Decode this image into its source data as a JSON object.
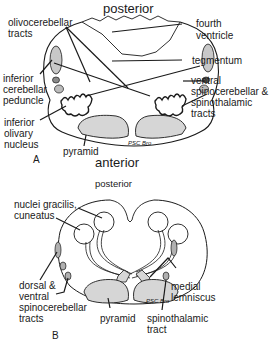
{
  "diagram_a": {
    "panel_letter": "A",
    "orientation_top": "posterior",
    "orientation_bottom": "anterior",
    "labels": {
      "olivocerebellar": [
        "olivocerebellar",
        "tracts"
      ],
      "fourth_ventricle": [
        "fourth",
        "ventricle"
      ],
      "tegmentum": "tegmentum",
      "inferior_cerebellar_peduncle": [
        "inferior",
        "cerebellar",
        "peduncle"
      ],
      "ventral_spinocerebellar": [
        "ventral",
        "spinocerebellar &",
        "spinothalamic",
        "tracts"
      ],
      "inferior_olivary_nucleus": [
        "inferior",
        "olivary",
        "nucleus"
      ],
      "pyramid": "pyramid"
    },
    "signature": "PSC Bro"
  },
  "diagram_b": {
    "panel_letter": "B",
    "orientation_top": "posterior",
    "labels": {
      "nuclei": [
        "nuclei gracilis,",
        "cuneatus"
      ],
      "dorsal_ventral": [
        "dorsal  &",
        "ventral",
        "spinocerebellar",
        "tracts"
      ],
      "pyramid": "pyramid",
      "medial_lemniscus": [
        "medial",
        "lemniscus"
      ],
      "spinothalamic": [
        "spinothalamic",
        "tract"
      ]
    },
    "signature": "PSC Bro"
  },
  "colors": {
    "ink": "#1a1a1a",
    "stipple": "#d6d6d6",
    "dark_fill": "#9a9a9a"
  }
}
